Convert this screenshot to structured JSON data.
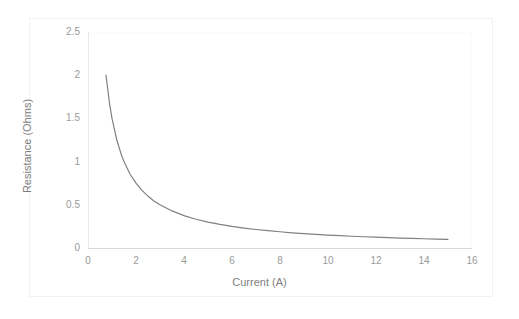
{
  "chart_data": {
    "type": "line",
    "title": "",
    "xlabel": "Current (A)",
    "ylabel": "Resistance (Ohms)",
    "xlim": [
      0,
      16
    ],
    "ylim": [
      0,
      2.5
    ],
    "xticks": [
      "0",
      "2",
      "4",
      "6",
      "8",
      "10",
      "12",
      "14",
      "16"
    ],
    "xtick_values": [
      0,
      2,
      4,
      6,
      8,
      10,
      12,
      14,
      16
    ],
    "yticks": [
      "0",
      "0.5",
      "1",
      "1.5",
      "2",
      "2.5"
    ],
    "ytick_values": [
      0,
      0.5,
      1,
      1.5,
      2,
      2.5
    ],
    "grid": false,
    "legend": "none",
    "relationship": "R = 1.5 / I",
    "series": [
      {
        "name": "Resistance vs Current",
        "color": "#808080",
        "line_width": 1.2,
        "x": [
          0.75,
          0.9,
          1.0,
          1.2,
          1.4,
          1.5,
          1.75,
          2.0,
          2.25,
          2.5,
          2.75,
          3.0,
          3.5,
          4.0,
          4.5,
          5.0,
          5.5,
          6.0,
          6.5,
          7.0,
          7.5,
          8.0,
          8.5,
          9.0,
          9.5,
          10.0,
          10.5,
          11.0,
          11.5,
          12.0,
          12.5,
          13.0,
          13.5,
          14.0,
          14.5,
          15.0
        ],
        "y": [
          2.0,
          1.667,
          1.5,
          1.25,
          1.071,
          1.0,
          0.857,
          0.75,
          0.667,
          0.6,
          0.545,
          0.5,
          0.429,
          0.375,
          0.333,
          0.3,
          0.273,
          0.25,
          0.231,
          0.214,
          0.2,
          0.188,
          0.176,
          0.167,
          0.158,
          0.15,
          0.143,
          0.136,
          0.13,
          0.125,
          0.12,
          0.115,
          0.111,
          0.107,
          0.103,
          0.1
        ]
      }
    ]
  },
  "colors": {
    "series": "#808080",
    "axis": "#d9d9d9",
    "tick_text": "#9a9a9a",
    "title_text": "#808080",
    "frame": "#f2f2f2",
    "background": "#ffffff"
  }
}
